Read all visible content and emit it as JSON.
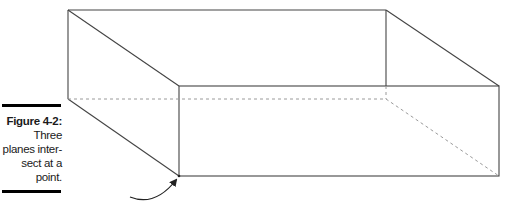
{
  "caption": {
    "label": "Figure 4-2:",
    "lines": [
      "Three",
      "planes inter-",
      "sect at a",
      "point."
    ]
  },
  "figure": {
    "stroke_color": "#444444",
    "dashed_color": "#999999"
  }
}
